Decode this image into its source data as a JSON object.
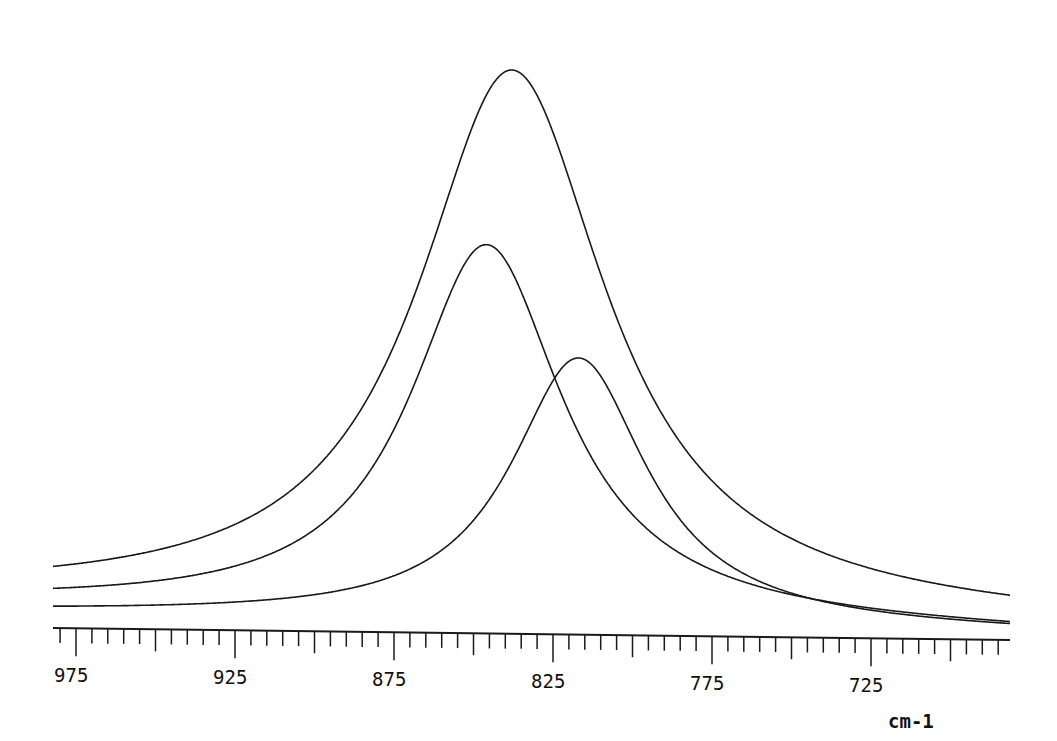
{
  "chart_data": {
    "type": "line",
    "title": "",
    "xlabel": "cm-1",
    "ylabel": "",
    "x_axis_reversed": true,
    "xlim": [
      982,
      681
    ],
    "major_ticks": [
      975,
      925,
      875,
      825,
      775,
      725
    ],
    "major_tick_labels": [
      "975",
      "925",
      "875",
      "825",
      "775",
      "725"
    ],
    "minor_tick_step": 5,
    "grid": false,
    "legend": null,
    "series": [
      {
        "name": "total band (sum)",
        "shape": "lorentzian-like",
        "peak_x": 838,
        "peak_height_rel": 1.0,
        "fwhm": 72,
        "baseline_left_rel": 0.055,
        "baseline_right_rel": 0.03
      },
      {
        "name": "component 1",
        "shape": "lorentzian",
        "peak_x": 846,
        "peak_height_rel": 0.69,
        "fwhm": 58,
        "baseline_left_rel": 0.043,
        "baseline_right_rel": 0.012
      },
      {
        "name": "component 2",
        "shape": "lorentzian",
        "peak_x": 817,
        "peak_height_rel": 0.49,
        "fwhm": 52,
        "baseline_left_rel": 0.028,
        "baseline_right_rel": 0.012
      }
    ]
  },
  "axis": {
    "unit": "cm-1"
  }
}
